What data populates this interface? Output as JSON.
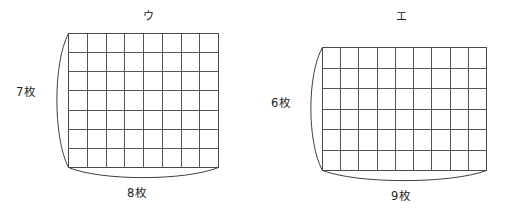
{
  "page": {
    "background_color": "#ffffff",
    "line_color": "#555555",
    "text_color": "#1f1f1f",
    "width": 509,
    "height": 215
  },
  "figures": [
    {
      "caption": "ウ",
      "height_label": "7枚",
      "width_label": "8枚",
      "columns": 8,
      "rows": 7,
      "caption_x": 143,
      "caption_y": 10,
      "height_label_x": 16,
      "height_label_y": 85,
      "width_label_x": 127,
      "width_label_y": 186,
      "grid_x": 68,
      "grid_y": 33,
      "grid_w": 150,
      "grid_h": 134,
      "left_bulge": 15,
      "bottom_bulge": 14
    },
    {
      "caption": "エ",
      "height_label": "6枚",
      "width_label": "9枚",
      "columns": 9,
      "rows": 6,
      "caption_x": 396,
      "caption_y": 10,
      "height_label_x": 271,
      "height_label_y": 96,
      "width_label_x": 391,
      "width_label_y": 189,
      "grid_x": 322,
      "grid_y": 47,
      "grid_w": 164,
      "grid_h": 123,
      "left_bulge": 15,
      "bottom_bulge": 14
    }
  ]
}
